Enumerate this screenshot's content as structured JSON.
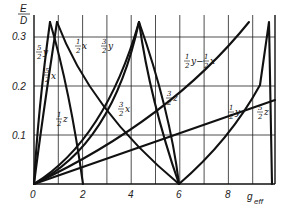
{
  "chart_data": {
    "type": "line",
    "title": "",
    "xlabel": "g_eff",
    "ylabel": "E/D",
    "xlim": [
      0,
      9.9
    ],
    "ylim": [
      0,
      0.333
    ],
    "x_ticks": [
      "0",
      "2",
      "4",
      "6",
      "8"
    ],
    "y_ticks": [
      "0.1",
      "0.2",
      "0.3"
    ],
    "grid": true,
    "legend": "inline labels on curves",
    "series": [
      {
        "name": "5/2 y",
        "x": [
          0,
          0.35,
          0.8
        ],
        "y": [
          0,
          0.18,
          0.333
        ]
      },
      {
        "name": "5/2 x",
        "x": [
          0,
          0.5,
          1.2
        ],
        "y": [
          0,
          0.15,
          0.333
        ]
      },
      {
        "name": "1/2 x",
        "x": [
          1.2,
          2,
          3,
          4,
          5,
          6
        ],
        "y": [
          0.333,
          0.22,
          0.14,
          0.09,
          0.045,
          0
        ]
      },
      {
        "name": "1/2 z",
        "x": [
          0.8,
          1.3,
          1.7,
          2.0
        ],
        "y": [
          0.333,
          0.2,
          0.1,
          0
        ]
      },
      {
        "name": "3/2 y",
        "x": [
          0,
          1,
          2,
          3,
          4.3
        ],
        "y": [
          0,
          0.05,
          0.11,
          0.19,
          0.333
        ]
      },
      {
        "name": "3/2 x",
        "x": [
          0,
          1,
          2,
          3,
          4.3
        ],
        "y": [
          0,
          0.045,
          0.1,
          0.175,
          0.333
        ]
      },
      {
        "name": "3/2 z",
        "x": [
          4.3,
          5,
          5.6,
          6.0
        ],
        "y": [
          0.333,
          0.22,
          0.12,
          0
        ]
      },
      {
        "name": "1/2 y - 1/2 x",
        "x": [
          0,
          2,
          4,
          6,
          8,
          8.85
        ],
        "y": [
          0,
          0.055,
          0.12,
          0.19,
          0.28,
          0.333
        ]
      },
      {
        "name": "1/2 y",
        "x": [
          6,
          7,
          8,
          9,
          9.3
        ],
        "y": [
          0,
          0.05,
          0.1,
          0.17,
          0.2
        ]
      },
      {
        "name": "5/2 z",
        "x": [
          9.3,
          9.5,
          9.67,
          9.8
        ],
        "y": [
          0.2,
          0.27,
          0.333,
          0.0
        ]
      },
      {
        "name": "3/2 x (desc)",
        "x": [
          4.3,
          5,
          5.6,
          6.0
        ],
        "y": [
          0.333,
          0.2,
          0.1,
          0
        ]
      },
      {
        "name": "origin line",
        "x": [
          0,
          4,
          9.9
        ],
        "y": [
          0,
          0.07,
          0.17
        ]
      }
    ],
    "annotations": [
      {
        "text": "5/2 y",
        "x": 0.05,
        "y": 0.27
      },
      {
        "text": "5/2 x",
        "x": 0.5,
        "y": 0.22
      },
      {
        "text": "1/2 x",
        "x": 1.7,
        "y": 0.28
      },
      {
        "text": "1/2 z",
        "x": 1.0,
        "y": 0.11
      },
      {
        "text": "3/2 y",
        "x": 2.7,
        "y": 0.28
      },
      {
        "text": "3/2 x",
        "x": 3.1,
        "y": 0.16
      },
      {
        "text": "3/2 z",
        "x": 5.4,
        "y": 0.16
      },
      {
        "text": "1/2 y - 1/2 x",
        "x": 6.4,
        "y": 0.24
      },
      {
        "text": "1/2 y",
        "x": 7.9,
        "y": 0.12
      },
      {
        "text": "5/2 z",
        "x": 9.0,
        "y": 0.12
      }
    ]
  },
  "axes": {
    "y_title_num": "E",
    "y_title_den": "D",
    "x_title": "g",
    "x_title_sub": "eff",
    "x_ticks": [
      "0",
      "2",
      "4",
      "6",
      "8"
    ],
    "y_ticks": [
      "0.1",
      "0.2",
      "0.3"
    ]
  }
}
